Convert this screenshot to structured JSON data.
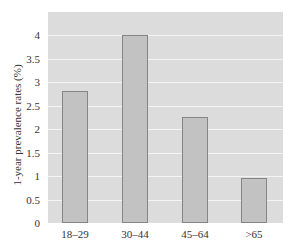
{
  "chart_data": {
    "type": "bar",
    "title": "",
    "xlabel": "",
    "ylabel": "1-year prevalence rates (%)",
    "categories": [
      "18–29",
      "30–44",
      "45–64",
      ">65"
    ],
    "values": [
      2.8,
      4.0,
      2.25,
      0.95
    ],
    "ylim": [
      0,
      4.5
    ],
    "yticks": [
      "0",
      "0.5",
      "1",
      "1.5",
      "2",
      "2.5",
      "3",
      "3.5",
      "4"
    ],
    "grid": true,
    "legend": null
  },
  "colors": {
    "plot_background": "#dcdcdc",
    "gridline": "#f4f4f4",
    "bar_fill": "#c2c2c2",
    "bar_border": "#858585"
  }
}
